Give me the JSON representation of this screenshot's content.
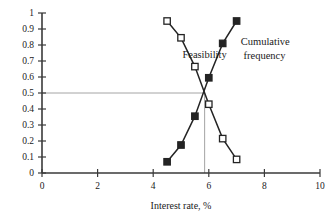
{
  "chart_data": {
    "type": "line",
    "title": "",
    "subtitle": "",
    "xlabel": "Interest rate, %",
    "ylabel": "",
    "xlim": [
      0,
      10
    ],
    "ylim": [
      0,
      1
    ],
    "xticks": [
      0,
      2,
      4,
      6,
      8,
      10
    ],
    "xtick_labels": [
      "0",
      "2",
      "4",
      "6",
      "8",
      "10"
    ],
    "yticks": [
      0,
      0.1,
      0.2,
      0.3,
      0.4,
      0.5,
      0.6,
      0.7,
      0.8,
      0.9,
      1
    ],
    "ytick_labels": [
      "0",
      "0.1",
      "0.2",
      "0.3",
      "0.4",
      "0.5",
      "0.6",
      "0.7",
      "0.8",
      "0.9",
      "1"
    ],
    "grid": false,
    "legend_position": "inline-annotations",
    "series": [
      {
        "name": "Feasibility",
        "marker": "open-square",
        "color": "#242424",
        "x": [
          4.5,
          5.0,
          5.5,
          6.0,
          6.5,
          7.0
        ],
        "values": [
          0.95,
          0.845,
          0.665,
          0.43,
          0.215,
          0.085
        ]
      },
      {
        "name": "Cumulative frequency",
        "marker": "filled-square",
        "color": "#242424",
        "x": [
          4.5,
          5.0,
          5.5,
          6.0,
          6.5,
          7.0
        ],
        "values": [
          0.07,
          0.175,
          0.355,
          0.595,
          0.81,
          0.95
        ]
      }
    ],
    "annotations": [
      {
        "text": "Feasibility",
        "x": 5.05,
        "y": 0.72
      },
      {
        "text": "Cumulative",
        "x": 7.15,
        "y": 0.8
      },
      {
        "text": "frequency",
        "x": 7.25,
        "y": 0.71
      }
    ],
    "reference_lines": [
      {
        "orientation": "horizontal",
        "value": 0.5,
        "from": 0,
        "to": 5.85,
        "color": "#9a9a9a"
      },
      {
        "orientation": "vertical",
        "value": 5.85,
        "from": 0,
        "to": 0.5,
        "color": "#9a9a9a"
      }
    ]
  },
  "labels": {
    "feasibility": "Feasibility",
    "cumulative_line1": "Cumulative",
    "cumulative_line2": "frequency",
    "xaxis_title": "Interest rate, %"
  }
}
